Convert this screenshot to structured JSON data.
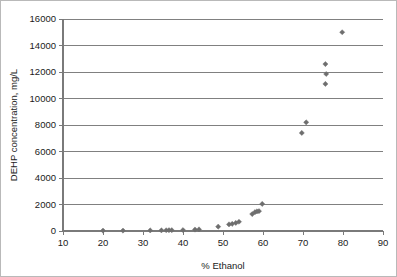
{
  "chart_data": {
    "type": "scatter",
    "title": "",
    "xlabel": "% Ethanol",
    "ylabel": "DEHP concentration, mg/L",
    "xlim": [
      10,
      90
    ],
    "ylim": [
      0,
      16000
    ],
    "xticks": [
      10,
      20,
      30,
      40,
      50,
      60,
      70,
      80,
      90
    ],
    "xtick_labels": [
      "10",
      "20",
      "30",
      "40",
      "50",
      "60",
      "70",
      "80",
      "90"
    ],
    "yticks": [
      0,
      2000,
      4000,
      6000,
      8000,
      10000,
      12000,
      14000,
      16000
    ],
    "ytick_labels": [
      "0",
      "2000",
      "4000",
      "6000",
      "8000",
      "10000",
      "12000",
      "14000",
      "16000"
    ],
    "grid": "horizontal",
    "legend": "none",
    "marker": "diamond",
    "marker_color": "#6e6e6e",
    "series": [
      {
        "name": "DEHP",
        "points": [
          [
            20.0,
            30
          ],
          [
            25.0,
            30
          ],
          [
            31.8,
            45
          ],
          [
            34.6,
            50
          ],
          [
            35.8,
            55
          ],
          [
            36.5,
            60
          ],
          [
            37.2,
            60
          ],
          [
            40.0,
            70
          ],
          [
            43.0,
            110
          ],
          [
            44.0,
            120
          ],
          [
            48.8,
            330
          ],
          [
            51.5,
            500
          ],
          [
            52.3,
            540
          ],
          [
            53.2,
            610
          ],
          [
            54.0,
            700
          ],
          [
            57.3,
            1280
          ],
          [
            58.0,
            1420
          ],
          [
            58.5,
            1480
          ],
          [
            59.0,
            1500
          ],
          [
            59.8,
            2040
          ],
          [
            69.7,
            7400
          ],
          [
            70.8,
            8200
          ],
          [
            75.6,
            11100
          ],
          [
            75.8,
            11850
          ],
          [
            75.6,
            12600
          ],
          [
            79.8,
            15000
          ]
        ]
      }
    ]
  }
}
